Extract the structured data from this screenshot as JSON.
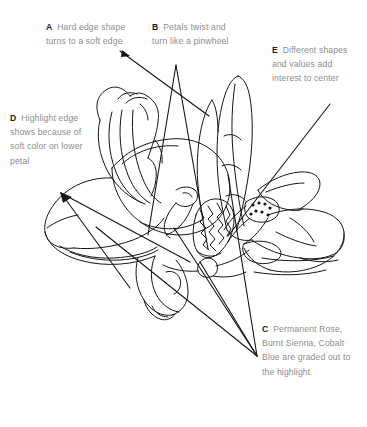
{
  "figure": {
    "background_color": "#ffffff",
    "ink_color": "#151515",
    "text_color": "#8d8d8d",
    "key_color": "#1b1b1b"
  },
  "callouts": [
    {
      "key": "A",
      "text": "Hard edge shape turns to a soft edge",
      "leader": "line from label down-right into upper-left petal tip"
    },
    {
      "key": "B",
      "text": "Petals twist and turn like a pinwheel",
      "leader": "two lines forming a V reaching down into the flower center"
    },
    {
      "key": "C",
      "text": "Permanent Rose, Burnt Sienna, Cobalt Blue are graded out to the highlight",
      "leader": "three lines fanning up-left from a convergence point"
    },
    {
      "key": "D",
      "text": "Highlight edge shows because of soft color on lower petal",
      "leader": "two lines fanning down-right onto the lower petal"
    },
    {
      "key": "E",
      "text": "Different shapes and values add interest to center",
      "leader": "line from label down-left into the stamen cluster"
    }
  ]
}
